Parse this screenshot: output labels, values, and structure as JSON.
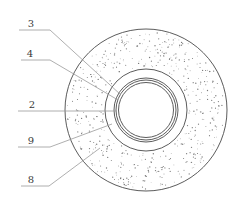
{
  "figure": {
    "type": "cross-section",
    "colors": {
      "background": "#ffffff",
      "stroke": "#4a4a4a",
      "leader": "#9a9a9a",
      "speckle": "#7a7a7a",
      "label": "#3a3a3a"
    },
    "center": {
      "x": 146,
      "y": 110
    },
    "rings": [
      {
        "id": "outer-layer-boundary",
        "r": 81
      },
      {
        "id": "inner-layer-boundary",
        "r": 41
      },
      {
        "id": "ring-a",
        "r": 32
      },
      {
        "id": "ring-b",
        "r": 30
      },
      {
        "id": "ring-c-bore",
        "r": 27.5
      }
    ]
  },
  "labels": [
    {
      "text": "3",
      "x": 31,
      "y": 24,
      "line": [
        [
          19,
          30
        ],
        [
          50,
          30
        ],
        [
          121,
          95
        ]
      ]
    },
    {
      "text": "4",
      "x": 30,
      "y": 54,
      "line": [
        [
          21,
          60
        ],
        [
          50,
          60
        ],
        [
          118,
          100
        ]
      ]
    },
    {
      "text": "2",
      "x": 32,
      "y": 105,
      "line": [
        [
          18,
          111
        ],
        [
          117,
          111
        ]
      ]
    },
    {
      "text": "9",
      "x": 31,
      "y": 141,
      "line": [
        [
          18,
          147
        ],
        [
          50,
          147
        ],
        [
          112,
          124
        ]
      ]
    },
    {
      "text": "8",
      "x": 31,
      "y": 180,
      "line": [
        [
          21,
          186
        ],
        [
          49,
          186
        ],
        [
          100,
          148
        ]
      ]
    }
  ]
}
